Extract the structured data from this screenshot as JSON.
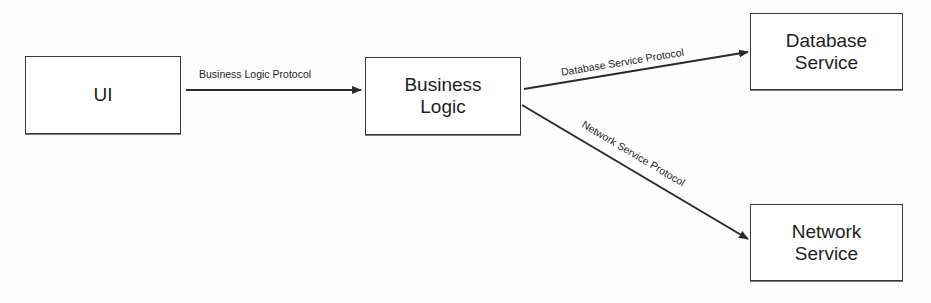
{
  "nodes": {
    "ui": {
      "label": "UI"
    },
    "business_logic": {
      "label": "Business\nLogic"
    },
    "database_service": {
      "label": "Database\nService"
    },
    "network_service": {
      "label": "Network\nService"
    }
  },
  "edges": {
    "ui_to_business": {
      "label": "Business Logic Protocol",
      "from": "UI",
      "to": "Business Logic"
    },
    "business_to_database": {
      "label": "Database Service Protocol",
      "from": "Business Logic",
      "to": "Database Service"
    },
    "business_to_network": {
      "label": "Network Service Protocol",
      "from": "Business Logic",
      "to": "Network Service"
    }
  },
  "colors": {
    "stroke": "#2a2a2a",
    "background": "#fdfdfd"
  }
}
